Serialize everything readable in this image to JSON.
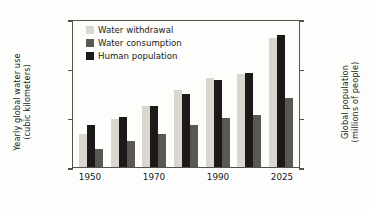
{
  "chart_data": {
    "type": "bar",
    "title": "",
    "categories": [
      "1950",
      "1960",
      "1970",
      "1980",
      "1990",
      "2000",
      "2025"
    ],
    "tick_labels_shown": [
      "1950",
      "1970",
      "1990",
      "2025"
    ],
    "xlabel": "",
    "ylabel": "Yearly global water use (cubic kilometers)",
    "ylabel_line1": "Yearly global water use",
    "ylabel_line2": "(cubic kilometers)",
    "y2label": "Global population (millions of people)",
    "y2label_line1": "Global population",
    "y2label_line2": "(millions of people)",
    "ylim": [
      0,
      6000
    ],
    "y2lim": [
      0,
      9000
    ],
    "yticks": [
      "0",
      "2000",
      "4000",
      "6000"
    ],
    "y2ticks": [
      "0",
      "3000",
      "6000",
      "9000"
    ],
    "grid": false,
    "legend_position": "top-left-inside",
    "series": [
      {
        "name": "Water withdrawal",
        "axis": "left",
        "units": "cubic kilometers",
        "color": "#d9d7d0",
        "values": [
          1360,
          1960,
          2480,
          3120,
          3620,
          3790,
          5230
        ]
      },
      {
        "name": "Human population",
        "axis": "right",
        "units": "millions of people",
        "color": "#1c1a18",
        "values": [
          2550,
          3030,
          3700,
          4440,
          5280,
          5700,
          8000
        ]
      },
      {
        "name": "Water consumption",
        "axis": "left",
        "units": "cubic kilometers",
        "color": "#5b5854",
        "values": [
          740,
          1050,
          1340,
          1690,
          1990,
          2090,
          2780
        ]
      }
    ]
  },
  "legend": {
    "items": [
      {
        "label": "Water withdrawal",
        "color": "#d9d7d0"
      },
      {
        "label": "Water consumption",
        "color": "#5b5854"
      },
      {
        "label": "Human population",
        "color": "#1c1a18"
      }
    ]
  }
}
